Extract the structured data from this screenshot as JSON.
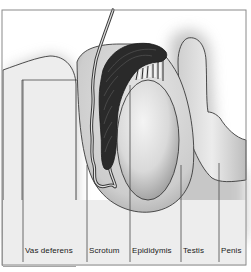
{
  "diagram": {
    "type": "anatomical-illustration",
    "labels": [
      {
        "id": "vas-deferens",
        "text": "Vas deferens",
        "x": 24
      },
      {
        "id": "scrotum",
        "text": "Scrotum",
        "x": 88
      },
      {
        "id": "epididymis",
        "text": "Epididymis",
        "x": 131
      },
      {
        "id": "testis",
        "text": "Testis",
        "x": 182
      },
      {
        "id": "penis",
        "text": "Penis",
        "x": 220
      }
    ],
    "colors": {
      "frame": "#8a8a8a",
      "outline": "#3a3a3a",
      "skin_fill": "#ececec",
      "shadow": "#9a9a9a",
      "epididymis_dark": "#2a2a2a",
      "label_text": "#1a1a1a"
    }
  }
}
